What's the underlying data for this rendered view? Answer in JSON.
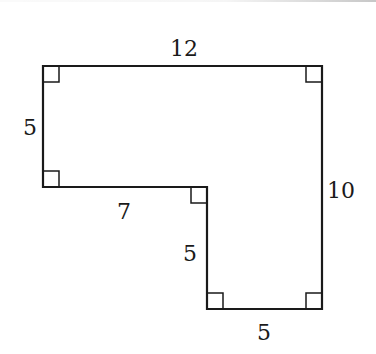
{
  "figure": {
    "type": "L-shaped polygon with right-angle markers",
    "stroke_color": "#1a1a1a",
    "vertices": [
      {
        "name": "top-left",
        "x": 43,
        "y": 66
      },
      {
        "name": "top-right",
        "x": 322,
        "y": 66
      },
      {
        "name": "bottom-right",
        "x": 322,
        "y": 309
      },
      {
        "name": "bottom-inner-left",
        "x": 207,
        "y": 309
      },
      {
        "name": "inner-corner",
        "x": 207,
        "y": 187
      },
      {
        "name": "bottom-left",
        "x": 43,
        "y": 187
      }
    ],
    "right_angle_markers": [
      {
        "corner": "top-left"
      },
      {
        "corner": "top-right"
      },
      {
        "corner": "bottom-left"
      },
      {
        "corner": "inner-corner"
      },
      {
        "corner": "bottom-inner-left"
      },
      {
        "corner": "bottom-right"
      }
    ],
    "labels": {
      "top": "12",
      "left": "5",
      "right": "10",
      "inner_horizontal": "7",
      "inner_vertical": "5",
      "bottom": "5"
    }
  }
}
